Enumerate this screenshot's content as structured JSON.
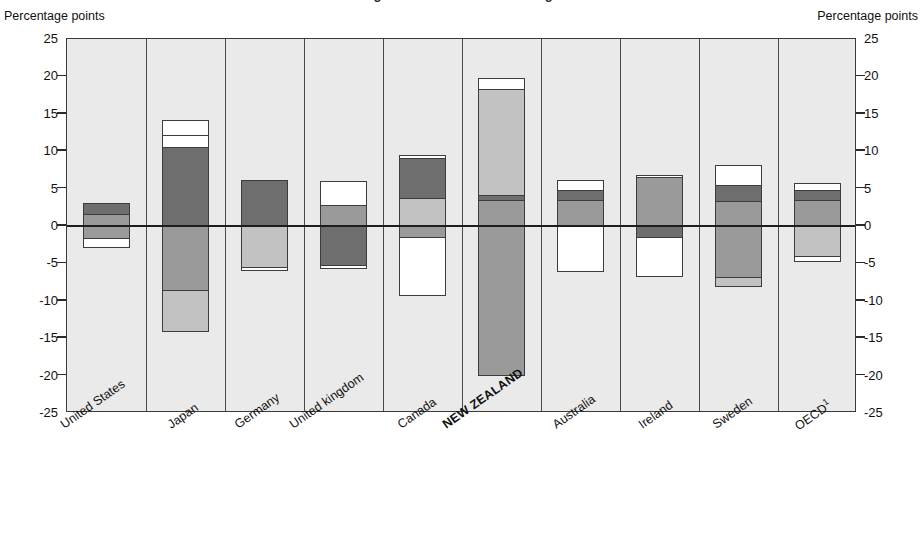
{
  "title": "Figure: Contributions to change",
  "axis": {
    "left_caption": "Percentage points",
    "right_caption": "Percentage points",
    "ticks": [
      "25",
      "20",
      "15",
      "10",
      "5",
      "0",
      "-5",
      "-10",
      "-15",
      "-20",
      "-25"
    ]
  },
  "colors": {
    "dark_gray": "#6e6e6e",
    "medium_gray": "#9a9a9a",
    "light_gray": "#c2c2c2",
    "white": "#ffffff",
    "plot_background": "#eaeaea",
    "axis_line": "#1d1d1d",
    "bar_outline": "#3c3c3c"
  },
  "chart_data": {
    "type": "bar",
    "subtype": "stacked-diverging",
    "title": "Figure: Contributions to change",
    "xlabel": "",
    "ylabel": "Percentage points",
    "ylim": [
      -25,
      25
    ],
    "ytick_step": 5,
    "grid": false,
    "legend": "none",
    "categories": [
      "United States",
      "Japan",
      "Germany",
      "United kingdom",
      "Canada",
      "NEW ZEALAND",
      "Australia",
      "Ireland",
      "Sweden",
      "OECD"
    ],
    "highlight_category": "NEW ZEALAND",
    "footnote_marker_category": "OECD",
    "stacks": [
      {
        "category": "United States",
        "total_positive": 3.1,
        "total_negative": -3.0,
        "segments": [
          {
            "from": 3.1,
            "to": 1.6,
            "color": "dark_gray",
            "value": 1.5
          },
          {
            "from": 1.6,
            "to": 0.0,
            "color": "medium_gray",
            "value": 1.6
          },
          {
            "from": 0.0,
            "to": -1.6,
            "color": "medium_gray",
            "value": -1.6
          },
          {
            "from": -1.6,
            "to": -3.0,
            "color": "white",
            "value": -1.4
          }
        ]
      },
      {
        "category": "Japan",
        "total_positive": 14.2,
        "total_negative": -14.2,
        "segments": [
          {
            "from": 14.2,
            "to": 12.2,
            "color": "white",
            "value": 2.0
          },
          {
            "from": 12.2,
            "to": 10.6,
            "color": "white",
            "value": 1.6
          },
          {
            "from": 10.6,
            "to": 0.0,
            "color": "dark_gray",
            "value": 10.6
          },
          {
            "from": 0.0,
            "to": -8.5,
            "color": "medium_gray",
            "value": -8.5
          },
          {
            "from": -8.5,
            "to": -14.2,
            "color": "light_gray",
            "value": -5.7
          }
        ]
      },
      {
        "category": "Germany",
        "total_positive": 6.2,
        "total_negative": -6.0,
        "segments": [
          {
            "from": 6.2,
            "to": 0.0,
            "color": "dark_gray",
            "value": 6.2
          },
          {
            "from": 0.0,
            "to": -5.5,
            "color": "light_gray",
            "value": -5.5
          },
          {
            "from": -5.5,
            "to": -6.0,
            "color": "white",
            "value": -0.5
          }
        ]
      },
      {
        "category": "United kingdom",
        "total_positive": 6.0,
        "total_negative": -5.7,
        "segments": [
          {
            "from": 6.0,
            "to": 2.8,
            "color": "white",
            "value": 3.2
          },
          {
            "from": 2.8,
            "to": 0.0,
            "color": "medium_gray",
            "value": 2.8
          },
          {
            "from": 0.0,
            "to": -5.2,
            "color": "dark_gray",
            "value": -5.2
          },
          {
            "from": -5.2,
            "to": -5.7,
            "color": "white",
            "value": -0.5
          }
        ]
      },
      {
        "category": "Canada",
        "total_positive": 9.5,
        "total_negative": -9.4,
        "segments": [
          {
            "from": 9.5,
            "to": 9.1,
            "color": "white",
            "value": 0.4
          },
          {
            "from": 9.1,
            "to": 3.8,
            "color": "dark_gray",
            "value": 5.3
          },
          {
            "from": 3.8,
            "to": 0.0,
            "color": "light_gray",
            "value": 3.8
          },
          {
            "from": 0.0,
            "to": -1.5,
            "color": "medium_gray",
            "value": -1.5
          },
          {
            "from": -1.5,
            "to": -9.4,
            "color": "white",
            "value": -7.9
          }
        ]
      },
      {
        "category": "NEW ZEALAND",
        "total_positive": 19.8,
        "total_negative": -20.0,
        "segments": [
          {
            "from": 19.8,
            "to": 18.3,
            "color": "white",
            "value": 1.5
          },
          {
            "from": 18.3,
            "to": 4.2,
            "color": "light_gray",
            "value": 14.1
          },
          {
            "from": 4.2,
            "to": 3.5,
            "color": "dark_gray",
            "value": 0.7
          },
          {
            "from": 3.5,
            "to": 0.0,
            "color": "medium_gray",
            "value": 3.5
          },
          {
            "from": 0.0,
            "to": -20.0,
            "color": "medium_gray",
            "value": -20.0
          }
        ]
      },
      {
        "category": "Australia",
        "total_positive": 6.2,
        "total_negative": -6.2,
        "segments": [
          {
            "from": 6.2,
            "to": 4.8,
            "color": "white",
            "value": 1.4
          },
          {
            "from": 4.8,
            "to": 3.5,
            "color": "dark_gray",
            "value": 1.3
          },
          {
            "from": 3.5,
            "to": 0.0,
            "color": "medium_gray",
            "value": 3.5
          },
          {
            "from": 0.0,
            "to": -6.2,
            "color": "white",
            "value": -6.2
          }
        ]
      },
      {
        "category": "Ireland",
        "total_positive": 6.8,
        "total_negative": -6.8,
        "segments": [
          {
            "from": 6.8,
            "to": 6.5,
            "color": "white",
            "value": 0.3
          },
          {
            "from": 6.5,
            "to": 0.0,
            "color": "medium_gray",
            "value": 6.5
          },
          {
            "from": 0.0,
            "to": -1.5,
            "color": "dark_gray",
            "value": -1.5
          },
          {
            "from": -1.5,
            "to": -6.8,
            "color": "white",
            "value": -5.3
          }
        ]
      },
      {
        "category": "Sweden",
        "total_positive": 8.2,
        "total_negative": -8.2,
        "segments": [
          {
            "from": 8.2,
            "to": 5.5,
            "color": "white",
            "value": 2.7
          },
          {
            "from": 5.5,
            "to": 3.3,
            "color": "dark_gray",
            "value": 2.2
          },
          {
            "from": 3.3,
            "to": 0.0,
            "color": "medium_gray",
            "value": 3.3
          },
          {
            "from": 0.0,
            "to": -6.8,
            "color": "medium_gray",
            "value": -6.8
          },
          {
            "from": -6.8,
            "to": -8.2,
            "color": "light_gray",
            "value": -1.4
          }
        ]
      },
      {
        "category": "OECD",
        "total_positive": 5.8,
        "total_negative": -4.8,
        "segments": [
          {
            "from": 5.8,
            "to": 4.8,
            "color": "white",
            "value": 1.0
          },
          {
            "from": 4.8,
            "to": 3.5,
            "color": "dark_gray",
            "value": 1.3
          },
          {
            "from": 3.5,
            "to": 0.0,
            "color": "medium_gray",
            "value": 3.5
          },
          {
            "from": 0.0,
            "to": -4.0,
            "color": "light_gray",
            "value": -4.0
          },
          {
            "from": -4.0,
            "to": -4.8,
            "color": "white",
            "value": -0.8
          }
        ]
      }
    ]
  }
}
